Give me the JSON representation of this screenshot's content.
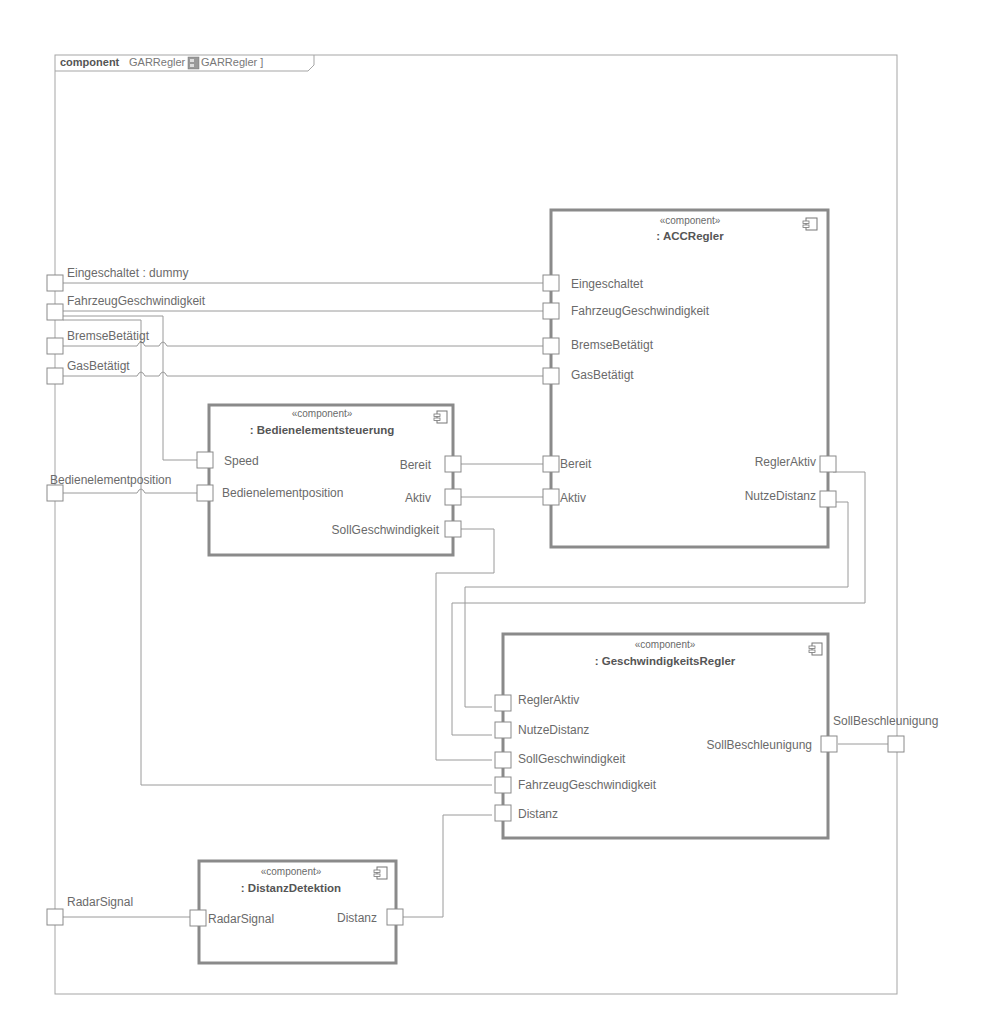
{
  "frame": {
    "keyword": "component",
    "name": "GARRegler [",
    "type_ref": "GARRegler ]",
    "type_icon": "component-type-icon"
  },
  "external_ports": {
    "eingeschaltet": "Eingeschaltet : dummy",
    "fahrzeug": "FahrzeugGeschwindigkeit",
    "bremse": "BremseBetätigt",
    "gas": "GasBetätigt",
    "bedien": "Bedienelementposition",
    "radar": "RadarSignal",
    "soll_beschl": "SollBeschleunigung"
  },
  "components": {
    "acc": {
      "stereotype": "«component»",
      "name": ": ACCRegler",
      "ports_left": [
        "Eingeschaltet",
        "FahrzeugGeschwindigkeit",
        "BremseBetätigt",
        "GasBetätigt",
        "Bereit",
        "Aktiv"
      ],
      "ports_right": [
        "ReglerAktiv",
        "NutzeDistanz"
      ]
    },
    "bedien": {
      "stereotype": "«component»",
      "name": ": Bedienelementsteuerung",
      "ports_left": [
        "Speed",
        "Bedienelementposition"
      ],
      "ports_right": [
        "Bereit",
        "Aktiv",
        "SollGeschwindigkeit"
      ]
    },
    "gr": {
      "stereotype": "«component»",
      "name": ": GeschwindigkeitsRegler",
      "ports_left": [
        "ReglerAktiv",
        "NutzeDistanz",
        "SollGeschwindigkeit",
        "FahrzeugGeschwindigkeit",
        "Distanz"
      ],
      "ports_right": [
        "SollBeschleunigung"
      ]
    },
    "dist": {
      "stereotype": "«component»",
      "name": ": DistanzDetektion",
      "ports_left": [
        "RadarSignal"
      ],
      "ports_right": [
        "Distanz"
      ]
    }
  },
  "colors": {
    "line": "#9a9a9a",
    "border": "#8a8a8a",
    "text": "#6a6a6a"
  }
}
